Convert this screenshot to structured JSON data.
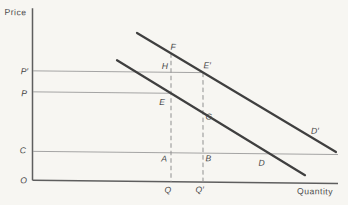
{
  "labels": {
    "price_axis": "Price",
    "quantity_axis": "Quantity",
    "origin": "O",
    "p_prime": "P′",
    "p": "P",
    "c": "C",
    "q": "Q",
    "q_prime": "Q′",
    "f": "F",
    "h": "H",
    "e_prime": "E′",
    "e": "E",
    "g": "G",
    "a": "A",
    "b": "B",
    "d": "D",
    "d_prime": "D′"
  },
  "colors": {
    "background": "#f7f6f2",
    "axis": "#5e5e5e",
    "thin_reference_line": "#9b9b9b",
    "dashed_line": "#8f8f8f",
    "demand_curve": "#3f3f3f",
    "text": "#474747"
  }
}
